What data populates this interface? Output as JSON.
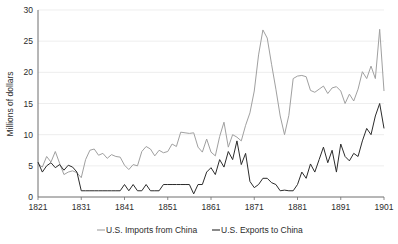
{
  "chart_data": {
    "type": "line",
    "title": "",
    "xlabel": "",
    "ylabel": "Millions of dollars",
    "xlim": [
      1821,
      1901
    ],
    "ylim": [
      0,
      30
    ],
    "ytick_values": [
      0,
      5,
      10,
      15,
      20,
      25,
      30
    ],
    "ytick_labels": [
      "0",
      "5",
      "10",
      "15",
      "20",
      "25",
      "30"
    ],
    "xtick_values": [
      1821,
      1831,
      1841,
      1851,
      1861,
      1871,
      1881,
      1891,
      1901
    ],
    "xtick_labels": [
      "1821",
      "1831",
      "1841",
      "1851",
      "1861",
      "1871",
      "1881",
      "1891",
      "1901"
    ],
    "grid": "horizontal",
    "legend_position": "bottom",
    "x": [
      1821,
      1822,
      1823,
      1824,
      1825,
      1826,
      1827,
      1828,
      1829,
      1830,
      1831,
      1832,
      1833,
      1834,
      1835,
      1836,
      1837,
      1838,
      1839,
      1840,
      1841,
      1842,
      1843,
      1844,
      1845,
      1846,
      1847,
      1848,
      1849,
      1850,
      1851,
      1852,
      1853,
      1854,
      1855,
      1856,
      1857,
      1858,
      1859,
      1860,
      1861,
      1862,
      1863,
      1864,
      1865,
      1866,
      1867,
      1868,
      1869,
      1870,
      1871,
      1872,
      1873,
      1874,
      1875,
      1876,
      1877,
      1878,
      1879,
      1880,
      1881,
      1882,
      1883,
      1884,
      1885,
      1886,
      1887,
      1888,
      1889,
      1890,
      1891,
      1892,
      1893,
      1894,
      1895,
      1896,
      1897,
      1898,
      1899,
      1900,
      1901
    ],
    "series": [
      {
        "name": "U.S. Imports from China",
        "color": "#a0a0a0",
        "values": [
          5.3,
          4.8,
          6.5,
          5.6,
          7.3,
          5.4,
          3.6,
          4.0,
          4.2,
          3.9,
          3.1,
          6.0,
          7.5,
          7.7,
          6.7,
          7.0,
          6.2,
          6.8,
          6.5,
          6.4,
          5.1,
          4.4,
          5.2,
          5.0,
          7.3,
          8.1,
          7.7,
          6.6,
          7.5,
          7.1,
          7.3,
          8.5,
          8.1,
          10.4,
          10.3,
          10.2,
          10.3,
          8.0,
          7.2,
          9.3,
          7.2,
          6.6,
          9.7,
          12.0,
          8.0,
          10.0,
          9.6,
          9.0,
          11.5,
          13.5,
          17.0,
          22.8,
          26.8,
          25.5,
          21.3,
          17.3,
          13.0,
          10.0,
          13.1,
          19.0,
          19.4,
          19.5,
          19.3,
          17.1,
          16.8,
          17.3,
          17.8,
          16.6,
          17.5,
          17.7,
          17.0,
          15.0,
          16.5,
          15.4,
          17.3,
          20.1,
          19.0,
          21.0,
          19.0,
          26.9,
          17.0
        ]
      },
      {
        "name": "U.S. Exports to China",
        "color": "#2b2b2b",
        "values": [
          5.6,
          4.0,
          5.0,
          5.5,
          4.7,
          5.2,
          4.3,
          5.1,
          4.8,
          4.0,
          1.0,
          1.0,
          1.0,
          1.0,
          1.0,
          1.0,
          1.0,
          1.0,
          1.0,
          1.0,
          2.0,
          1.0,
          2.0,
          1.0,
          1.0,
          2.0,
          1.0,
          1.0,
          1.0,
          2.0,
          2.0,
          2.0,
          2.0,
          2.0,
          2.0,
          2.0,
          0.5,
          2.0,
          2.0,
          4.0,
          4.7,
          3.6,
          6.0,
          4.8,
          7.3,
          6.0,
          9.0,
          5.2,
          7.0,
          2.5,
          1.5,
          2.0,
          3.0,
          3.0,
          2.3,
          2.0,
          1.0,
          1.1,
          1.0,
          1.0,
          2.0,
          4.0,
          3.0,
          5.3,
          4.0,
          6.0,
          8.0,
          5.5,
          7.5,
          4.0,
          8.5,
          6.5,
          5.8,
          7.0,
          6.5,
          9.0,
          11.0,
          10.0,
          13.0,
          15.0,
          11.0
        ]
      }
    ]
  },
  "legend": {
    "items": [
      {
        "label": "U.S. Imports from China",
        "dash": "—"
      },
      {
        "label": "U.S. Exports to China",
        "dash": "—"
      }
    ]
  }
}
